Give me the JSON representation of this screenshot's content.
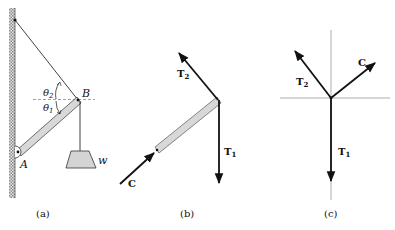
{
  "figure": {
    "panels": [
      {
        "id": "a",
        "caption": "(a)",
        "labels": {
          "theta2": "θ",
          "theta2_sub": "2",
          "theta1": "θ",
          "theta1_sub": "1",
          "point_b": "B",
          "point_a": "A",
          "weight": "w"
        }
      },
      {
        "id": "b",
        "caption": "(b)",
        "labels": {
          "t2": "T",
          "t2_sub": "2",
          "t1": "T",
          "t1_sub": "1",
          "c": "C"
        }
      },
      {
        "id": "c",
        "caption": "(c)",
        "labels": {
          "t2": "T",
          "t2_sub": "2",
          "t1": "T",
          "t1_sub": "1",
          "c": "C"
        }
      }
    ],
    "colors": {
      "line": "#111111",
      "rod_fill": "#d8d8d8",
      "weight_fill": "#d4d4d4",
      "wall_hatch": "#9a9a9a",
      "guide": "#999999"
    }
  }
}
